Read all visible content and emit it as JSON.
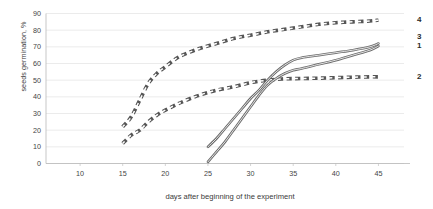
{
  "chart_data": {
    "type": "line",
    "title": "",
    "xlabel": "days after beginning of the experiment",
    "ylabel": "seeds germination, %",
    "xlim": [
      6,
      48
    ],
    "ylim": [
      0,
      90
    ],
    "grid": true,
    "grid_axis": "y",
    "legend_position": "right-edge-labels",
    "xticks": [
      "10",
      "15",
      "20",
      "25",
      "30",
      "35",
      "40",
      "45"
    ],
    "xtick_values": [
      10,
      15,
      20,
      25,
      30,
      35,
      40,
      45
    ],
    "yticks": [
      "0",
      "10",
      "20",
      "30",
      "40",
      "50",
      "60",
      "70",
      "80",
      "90"
    ],
    "ytick_values": [
      0,
      10,
      20,
      30,
      40,
      50,
      60,
      70,
      80,
      90
    ],
    "series": [
      {
        "name": "4",
        "label": "4",
        "style": "dashed",
        "color": "#565656",
        "x": [
          15,
          16,
          17,
          18,
          19,
          20,
          21,
          22,
          24,
          26,
          28,
          30,
          32,
          34,
          36,
          38,
          40,
          42,
          44,
          45
        ],
        "values": [
          22,
          28,
          38,
          48,
          54,
          58,
          62,
          65,
          69,
          72,
          75,
          77,
          79,
          80.5,
          82,
          83.5,
          84.5,
          85,
          85.5,
          86
        ]
      },
      {
        "name": "2",
        "label": "2",
        "style": "dashed",
        "color": "#565656",
        "x": [
          15,
          16,
          17,
          18,
          19,
          20,
          22,
          24,
          26,
          28,
          30,
          32,
          34,
          36,
          38,
          40,
          42,
          44,
          45
        ],
        "values": [
          12,
          17,
          20,
          25,
          29,
          32,
          37,
          41,
          44,
          46,
          48.5,
          50,
          50.8,
          51,
          51.2,
          51.5,
          51.8,
          52,
          52
        ]
      },
      {
        "name": "3",
        "label": "3",
        "style": "solid",
        "color": "#6b6b6b",
        "x": [
          25,
          26,
          27,
          28,
          29,
          30,
          31,
          32,
          33,
          34,
          35,
          36,
          38,
          40,
          42,
          44,
          45
        ],
        "values": [
          10,
          15,
          21,
          27,
          33,
          39,
          44,
          50,
          55,
          59,
          62,
          63.5,
          65,
          66.5,
          68,
          70,
          72
        ]
      },
      {
        "name": "1",
        "label": "1",
        "style": "solid",
        "color": "#6b6b6b",
        "x": [
          25,
          26,
          27,
          28,
          29,
          30,
          31,
          32,
          33,
          34,
          35,
          36,
          38,
          40,
          42,
          44,
          45
        ],
        "values": [
          1,
          7,
          13,
          20,
          27,
          34,
          41,
          47,
          51,
          54,
          56,
          57,
          59.5,
          62,
          65,
          68,
          70.5
        ]
      }
    ],
    "series_edge_labels": [
      {
        "label": "4",
        "at_y": 86
      },
      {
        "label": "3",
        "at_y": 76
      },
      {
        "label": "1",
        "at_y": 70.5
      },
      {
        "label": "2",
        "at_y": 52
      }
    ]
  }
}
